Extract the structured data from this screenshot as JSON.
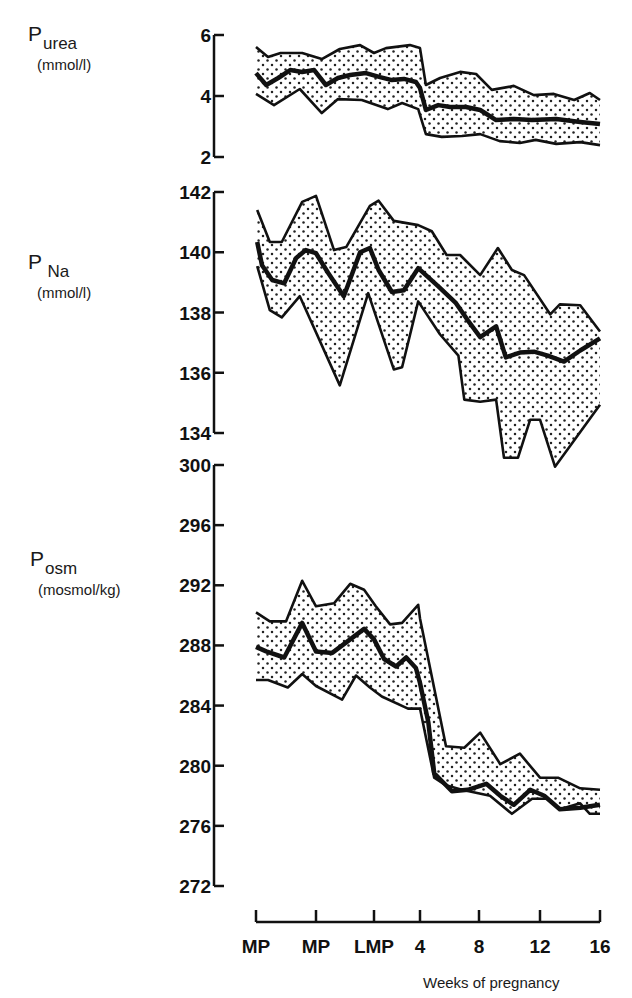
{
  "chart_data": [
    {
      "type": "line",
      "title": "Plasma urea",
      "ylabel": "P_urea (mmol/l)",
      "xlabel": "Weeks of pregnancy",
      "x_ticks": [
        "MP",
        "MP",
        "LMP",
        "4",
        "8",
        "12",
        "16"
      ],
      "ylim": [
        2,
        6
      ],
      "y_ticks": [
        6,
        4,
        2
      ],
      "band": "shaded range (dotted fill)",
      "series": [
        {
          "name": "mean",
          "points": [
            [
              0,
              4.75
            ],
            [
              0.17,
              4.36
            ],
            [
              0.37,
              4.59
            ],
            [
              0.57,
              4.85
            ],
            [
              0.77,
              4.79
            ],
            [
              0.97,
              4.85
            ],
            [
              1.17,
              4.36
            ],
            [
              1.38,
              4.59
            ],
            [
              1.59,
              4.69
            ],
            [
              1.86,
              4.75
            ],
            [
              2.13,
              4.62
            ],
            [
              2.39,
              4.52
            ],
            [
              2.65,
              4.56
            ],
            [
              2.91,
              4.46
            ],
            [
              3,
              4.26
            ],
            [
              3.1,
              3.54
            ],
            [
              3.31,
              3.7
            ],
            [
              3.51,
              3.64
            ],
            [
              3.78,
              3.64
            ],
            [
              4.02,
              3.54
            ],
            [
              4.28,
              3.21
            ],
            [
              4.57,
              3.25
            ],
            [
              4.87,
              3.21
            ],
            [
              5.27,
              3.25
            ],
            [
              5.67,
              3.15
            ],
            [
              6,
              3.08
            ]
          ]
        },
        {
          "name": "upper",
          "points": [
            [
              0,
              5.61
            ],
            [
              0.2,
              5.28
            ],
            [
              0.41,
              5.41
            ],
            [
              0.77,
              5.41
            ],
            [
              1.1,
              5.21
            ],
            [
              1.41,
              5.54
            ],
            [
              1.76,
              5.67
            ],
            [
              2,
              5.41
            ],
            [
              2.26,
              5.57
            ],
            [
              2.78,
              5.67
            ],
            [
              3,
              5.57
            ],
            [
              3.1,
              4.36
            ],
            [
              3.34,
              4.59
            ],
            [
              3.68,
              4.79
            ],
            [
              3.95,
              4.72
            ],
            [
              4.21,
              4.2
            ],
            [
              4.57,
              4.33
            ],
            [
              4.9,
              4.03
            ],
            [
              5.23,
              4.07
            ],
            [
              5.57,
              3.87
            ],
            [
              5.83,
              4.1
            ],
            [
              6,
              3.87
            ]
          ]
        },
        {
          "name": "lower",
          "points": [
            [
              0,
              4.07
            ],
            [
              0.3,
              3.7
            ],
            [
              0.73,
              4.23
            ],
            [
              1.1,
              3.44
            ],
            [
              1.38,
              3.9
            ],
            [
              1.79,
              3.87
            ],
            [
              2.3,
              3.57
            ],
            [
              2.61,
              3.77
            ],
            [
              2.96,
              3.57
            ],
            [
              3.1,
              2.75
            ],
            [
              3.37,
              2.66
            ],
            [
              3.71,
              2.69
            ],
            [
              4.02,
              2.75
            ],
            [
              4.34,
              2.52
            ],
            [
              4.67,
              2.46
            ],
            [
              4.93,
              2.56
            ],
            [
              5.27,
              2.43
            ],
            [
              5.67,
              2.49
            ],
            [
              6,
              2.39
            ]
          ]
        }
      ]
    },
    {
      "type": "line",
      "title": "Plasma sodium",
      "ylabel": "P_Na (mmol/l)",
      "xlabel": "Weeks of pregnancy",
      "x_ticks": [
        "MP",
        "MP",
        "LMP",
        "4",
        "8",
        "12",
        "16"
      ],
      "ylim": [
        134,
        142
      ],
      "y_ticks": [
        142,
        140,
        138,
        136,
        134
      ],
      "band": "shaded range (dotted fill)",
      "series": [
        {
          "name": "mean",
          "points": [
            [
              0.02,
              140.34
            ],
            [
              0.1,
              139.57
            ],
            [
              0.27,
              139.08
            ],
            [
              0.47,
              138.97
            ],
            [
              0.67,
              139.81
            ],
            [
              0.83,
              140.07
            ],
            [
              1,
              139.97
            ],
            [
              1.21,
              139.31
            ],
            [
              1.48,
              138.54
            ],
            [
              1.76,
              140.0
            ],
            [
              1.93,
              140.14
            ],
            [
              2.1,
              139.41
            ],
            [
              2.39,
              138.68
            ],
            [
              2.65,
              138.74
            ],
            [
              2.96,
              139.47
            ],
            [
              3.31,
              138.87
            ],
            [
              3.61,
              138.31
            ],
            [
              3.81,
              137.74
            ],
            [
              4.02,
              137.18
            ],
            [
              4.28,
              137.54
            ],
            [
              4.44,
              136.51
            ],
            [
              4.67,
              136.67
            ],
            [
              4.9,
              136.7
            ],
            [
              5.13,
              136.57
            ],
            [
              5.4,
              136.37
            ],
            [
              5.67,
              136.74
            ],
            [
              6,
              137.14
            ]
          ]
        },
        {
          "name": "upper",
          "points": [
            [
              0.02,
              141.4
            ],
            [
              0.23,
              140.34
            ],
            [
              0.43,
              140.34
            ],
            [
              0.77,
              141.67
            ],
            [
              1,
              141.87
            ],
            [
              1.31,
              140.07
            ],
            [
              1.52,
              140.17
            ],
            [
              1.93,
              141.54
            ],
            [
              2.1,
              141.71
            ],
            [
              2.43,
              141.04
            ],
            [
              2.96,
              140.9
            ],
            [
              3.2,
              140.7
            ],
            [
              3.45,
              139.91
            ],
            [
              3.68,
              139.91
            ],
            [
              4.02,
              139.24
            ],
            [
              4.31,
              140.14
            ],
            [
              4.54,
              139.41
            ],
            [
              4.74,
              139.24
            ],
            [
              5.17,
              137.94
            ],
            [
              5.33,
              138.27
            ],
            [
              5.67,
              138.24
            ],
            [
              6,
              137.37
            ]
          ]
        },
        {
          "name": "lower",
          "points": [
            [
              0.02,
              139.54
            ],
            [
              0.23,
              138.08
            ],
            [
              0.43,
              137.84
            ],
            [
              0.73,
              138.54
            ],
            [
              1.41,
              135.58
            ],
            [
              1.9,
              138.64
            ],
            [
              2.43,
              136.11
            ],
            [
              2.61,
              136.18
            ],
            [
              2.96,
              138.37
            ],
            [
              3.34,
              137.27
            ],
            [
              3.65,
              136.57
            ],
            [
              3.75,
              135.11
            ],
            [
              4.02,
              135.04
            ],
            [
              4.28,
              135.11
            ],
            [
              4.41,
              133.18
            ],
            [
              4.64,
              133.18
            ],
            [
              4.84,
              134.44
            ],
            [
              5,
              134.44
            ],
            [
              5.25,
              132.88
            ],
            [
              5.58,
              133.78
            ],
            [
              6,
              134.94
            ]
          ]
        }
      ]
    },
    {
      "type": "line",
      "title": "Plasma osmolality",
      "ylabel": "P_osm (mosmol/kg)",
      "xlabel": "Weeks of pregnancy",
      "x_ticks": [
        "MP",
        "MP",
        "LMP",
        "4",
        "8",
        "12",
        "16"
      ],
      "ylim": [
        272,
        300
      ],
      "y_ticks": [
        300,
        296,
        292,
        288,
        284,
        280,
        276,
        272
      ],
      "band": "shaded range (dotted fill)",
      "series": [
        {
          "name": "mean",
          "points": [
            [
              0,
              287.9
            ],
            [
              0.17,
              287.6
            ],
            [
              0.47,
              287.2
            ],
            [
              0.77,
              289.5
            ],
            [
              1,
              287.6
            ],
            [
              1.28,
              287.5
            ],
            [
              1.52,
              288.2
            ],
            [
              1.83,
              289.1
            ],
            [
              2,
              288.4
            ],
            [
              2.22,
              287.1
            ],
            [
              2.48,
              286.6
            ],
            [
              2.7,
              287.2
            ],
            [
              2.91,
              286.5
            ],
            [
              3,
              285.5
            ],
            [
              3.14,
              282.9
            ],
            [
              3.24,
              279.5
            ],
            [
              3.54,
              278.3
            ],
            [
              3.81,
              278.4
            ],
            [
              4.12,
              278.8
            ],
            [
              4.35,
              278.0
            ],
            [
              4.57,
              277.4
            ],
            [
              4.84,
              278.4
            ],
            [
              5.07,
              278.0
            ],
            [
              5.33,
              277.1
            ],
            [
              5.67,
              277.2
            ],
            [
              6,
              277.4
            ]
          ]
        },
        {
          "name": "upper",
          "points": [
            [
              0,
              290.2
            ],
            [
              0.23,
              289.6
            ],
            [
              0.5,
              289.6
            ],
            [
              0.77,
              292.3
            ],
            [
              1,
              290.6
            ],
            [
              1.31,
              290.8
            ],
            [
              1.59,
              292.1
            ],
            [
              1.83,
              291.7
            ],
            [
              2.04,
              290.6
            ],
            [
              2.35,
              289.4
            ],
            [
              2.61,
              289.5
            ],
            [
              2.96,
              290.7
            ],
            [
              3,
              289.8
            ],
            [
              3.44,
              281.3
            ],
            [
              3.75,
              281.2
            ],
            [
              4.02,
              282.2
            ],
            [
              4.35,
              280.1
            ],
            [
              4.67,
              280.8
            ],
            [
              5,
              279.2
            ],
            [
              5.3,
              279.2
            ],
            [
              5.67,
              278.5
            ],
            [
              6,
              278.4
            ]
          ]
        },
        {
          "name": "lower",
          "points": [
            [
              0,
              285.7
            ],
            [
              0.2,
              285.7
            ],
            [
              0.53,
              285.2
            ],
            [
              0.77,
              286.1
            ],
            [
              1,
              285.3
            ],
            [
              1.45,
              284.4
            ],
            [
              1.69,
              286.0
            ],
            [
              1.93,
              285.2
            ],
            [
              2.17,
              284.6
            ],
            [
              2.74,
              283.8
            ],
            [
              3,
              283.8
            ],
            [
              3.24,
              279.2
            ],
            [
              3.44,
              278.7
            ],
            [
              3.71,
              278.4
            ],
            [
              4.18,
              278.0
            ],
            [
              4.54,
              276.8
            ],
            [
              4.87,
              277.8
            ],
            [
              5.13,
              277.8
            ],
            [
              5.33,
              277.1
            ],
            [
              5.67,
              277.5
            ],
            [
              5.83,
              276.8
            ],
            [
              6,
              276.8
            ]
          ]
        }
      ]
    }
  ],
  "panels": [
    {
      "label_main": "P",
      "label_sub": "urea",
      "unit": "(mmol/l)",
      "ticks": [
        "6",
        "4",
        "2"
      ]
    },
    {
      "label_main": "P",
      "label_sub": "Na",
      "unit": "(mmol/l)",
      "ticks": [
        "142",
        "140",
        "138",
        "136",
        "134"
      ]
    },
    {
      "label_main": "P",
      "label_sub": "osm",
      "unit": "(mosmol/kg)",
      "ticks": [
        "300",
        "296",
        "292",
        "288",
        "284",
        "280",
        "276",
        "272"
      ]
    }
  ],
  "x_axis": {
    "ticks": [
      "MP",
      "MP",
      "LMP",
      "4",
      "8",
      "12",
      "16"
    ],
    "title": "Weeks of pregnancy"
  },
  "colors": {
    "ink": "#111111",
    "fill": "#ffffff",
    "dot": "#222222"
  }
}
